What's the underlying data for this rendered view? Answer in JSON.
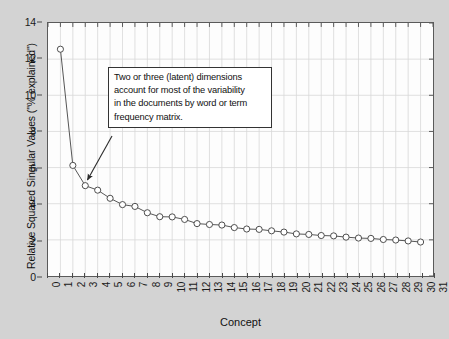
{
  "chart_data": {
    "type": "line",
    "title": "",
    "subtitle": "",
    "xlabel": "Concept",
    "ylabel": "Relative Squared Singular Values (\"% explained\")",
    "xlim": [
      0,
      31
    ],
    "ylim": [
      0,
      14
    ],
    "grid": true,
    "legend": null,
    "marker": "open-circle",
    "line_color": "#555555",
    "marker_color": "#444444",
    "x_tick_labels": [
      "0",
      "1",
      "2",
      "3",
      "4",
      "5",
      "6",
      "7",
      "8",
      "9",
      "10",
      "11",
      "12",
      "13",
      "14",
      "15",
      "16",
      "17",
      "18",
      "19",
      "20",
      "21",
      "22",
      "23",
      "24",
      "25",
      "26",
      "27",
      "28",
      "29",
      "30",
      "31"
    ],
    "y_tick_labels": [
      "0",
      "2",
      "4",
      "6",
      "8",
      "10",
      "12",
      "14"
    ],
    "y_ticks": [
      0,
      2,
      4,
      6,
      8,
      10,
      12,
      14
    ],
    "x": [
      1,
      2,
      3,
      4,
      5,
      6,
      7,
      8,
      9,
      10,
      11,
      12,
      13,
      14,
      15,
      16,
      17,
      18,
      19,
      20,
      21,
      22,
      23,
      24,
      25,
      26,
      27,
      28,
      29,
      30
    ],
    "values": [
      12.55,
      6.12,
      5.0,
      4.75,
      4.3,
      3.95,
      3.85,
      3.5,
      3.28,
      3.27,
      3.13,
      2.9,
      2.85,
      2.82,
      2.68,
      2.6,
      2.58,
      2.5,
      2.43,
      2.33,
      2.3,
      2.24,
      2.22,
      2.15,
      2.1,
      2.08,
      2.02,
      1.99,
      1.94,
      1.88
    ],
    "series": [
      {
        "name": "Relative Squared Singular Values",
        "values": [
          12.55,
          6.12,
          5.0,
          4.75,
          4.3,
          3.95,
          3.85,
          3.5,
          3.28,
          3.27,
          3.13,
          2.9,
          2.85,
          2.82,
          2.68,
          2.6,
          2.58,
          2.5,
          2.43,
          2.33,
          2.3,
          2.24,
          2.22,
          2.15,
          2.1,
          2.08,
          2.02,
          1.99,
          1.94,
          1.88
        ]
      }
    ],
    "annotations": [
      {
        "text": "Two or three (latent) dimensions account for most of the variability in the documents by word or term frequency matrix.",
        "lines": [
          "Two or three (latent) dimensions",
          "account for most of the variability",
          "in the documents by word or term",
          "frequency matrix."
        ],
        "points_to_x": 3,
        "points_to_y": 5.0,
        "box_border_color": "#333333",
        "box_background": "#ffffff"
      }
    ]
  },
  "figure": {
    "background_color": "#d3d3d3",
    "plot_background_color": "#fdfdfd",
    "frame_color": "#5a5a5a",
    "grid_color": "#d8d8d8"
  }
}
